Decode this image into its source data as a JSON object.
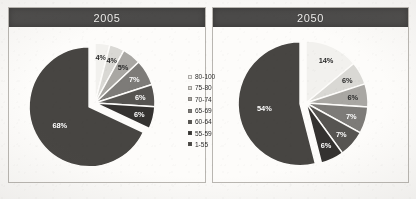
{
  "figure": {
    "background_color": "#fbfaf8",
    "title_bar_color": "#4b4a49",
    "panel_border_color": "#b9b6b1"
  },
  "panels": [
    {
      "id": "2005",
      "title": "2005"
    },
    {
      "id": "2050",
      "title": "2050"
    }
  ],
  "legend": {
    "position": "center-between-panels",
    "items": [
      {
        "label": "80-100",
        "color": "#f2f1ee"
      },
      {
        "label": "75-80",
        "color": "#d9d8d4"
      },
      {
        "label": "70-74",
        "color": "#a9a7a3"
      },
      {
        "label": "65-69",
        "color": "#7d7b78"
      },
      {
        "label": "60-64",
        "color": "#565451"
      },
      {
        "label": "55-59",
        "color": "#343230"
      },
      {
        "label": "1-55",
        "color": "#474542"
      }
    ]
  },
  "chart_data": [
    {
      "type": "pie",
      "title": "2005",
      "categories": [
        "80-100",
        "75-80",
        "70-74",
        "65-69",
        "60-64",
        "55-59",
        "1-55"
      ],
      "values": [
        4,
        4,
        5,
        7,
        6,
        6,
        68
      ],
      "labels": [
        "4%",
        "4%",
        "5%",
        "7%",
        "6%",
        "6%",
        "68%"
      ],
      "colors": [
        "#f2f1ee",
        "#d9d8d4",
        "#a9a7a3",
        "#7d7b78",
        "#565451",
        "#343230",
        "#474542"
      ],
      "exploded_slice": "1-55",
      "start_angle_deg": -90,
      "legend": [
        "80-100",
        "75-80",
        "70-74",
        "65-69",
        "60-64",
        "55-59",
        "1-55"
      ]
    },
    {
      "type": "pie",
      "title": "2050",
      "categories": [
        "80-100",
        "75-80",
        "70-74",
        "65-69",
        "60-64",
        "55-59",
        "1-55"
      ],
      "values": [
        14,
        6,
        6,
        7,
        7,
        6,
        54
      ],
      "labels": [
        "14%",
        "6%",
        "6%",
        "7%",
        "7%",
        "6%",
        "54%"
      ],
      "colors": [
        "#f2f1ee",
        "#d9d8d4",
        "#a9a7a3",
        "#7d7b78",
        "#565451",
        "#343230",
        "#474542"
      ],
      "exploded_slice": "1-55",
      "start_angle_deg": -90,
      "legend": [
        "80-100",
        "75-80",
        "70-74",
        "65-69",
        "60-64",
        "55-59",
        "1-55"
      ]
    }
  ]
}
